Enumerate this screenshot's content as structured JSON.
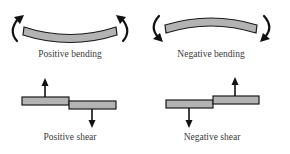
{
  "diagram": {
    "panels": [
      {
        "id": "positive-bending",
        "label": "Positive bending",
        "type": "bending",
        "curvature": "concave-up",
        "moment_arrows": "clockwise-left/counterclockwise-right"
      },
      {
        "id": "negative-bending",
        "label": "Negative bending",
        "type": "bending",
        "curvature": "concave-down",
        "moment_arrows": "counterclockwise-left/clockwise-right"
      },
      {
        "id": "positive-shear",
        "label": "Positive shear",
        "type": "shear",
        "left_force": "up",
        "right_force": "down"
      },
      {
        "id": "negative-shear",
        "label": "Negative shear",
        "type": "shear",
        "left_force": "down",
        "right_force": "up"
      }
    ],
    "colors": {
      "beam_fill": "#b3b3b3",
      "outline": "#1a1a1a",
      "arrow": "#111111",
      "label_text": "#3a3a3a",
      "background": "#ffffff"
    }
  }
}
